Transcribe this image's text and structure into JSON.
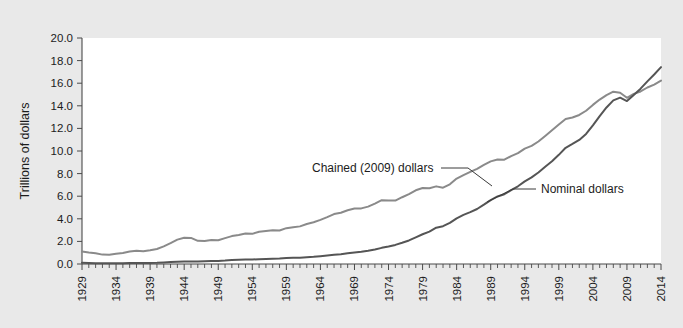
{
  "figure": {
    "background_color": "#e9e9e9",
    "plot_background_color": "#ffffff"
  },
  "axis": {
    "ylabel": "Trillions of dollars",
    "y_ticks": [
      "0.0",
      "2.0",
      "4.0",
      "6.0",
      "8.0",
      "10.0",
      "12.0",
      "14.0",
      "16.0",
      "18.0",
      "20.0"
    ],
    "x_ticks": [
      "1929",
      "1934",
      "1939",
      "1944",
      "1949",
      "1954",
      "1959",
      "1964",
      "1969",
      "1974",
      "1979",
      "1984",
      "1989",
      "1994",
      "1999",
      "2004",
      "2009",
      "2014"
    ]
  },
  "annotations": {
    "chained_label": "Chained (2009) dollars",
    "nominal_label": "Nominal dollars"
  },
  "chart_data": {
    "type": "line",
    "title": "",
    "xlabel": "",
    "ylabel": "Trillions of dollars",
    "xlim": [
      1929,
      2014
    ],
    "ylim": [
      0.0,
      20.0
    ],
    "grid": false,
    "legend_position": "inline-annotation",
    "x": [
      1929,
      1930,
      1931,
      1932,
      1933,
      1934,
      1935,
      1936,
      1937,
      1938,
      1939,
      1940,
      1941,
      1942,
      1943,
      1944,
      1945,
      1946,
      1947,
      1948,
      1949,
      1950,
      1951,
      1952,
      1953,
      1954,
      1955,
      1956,
      1957,
      1958,
      1959,
      1960,
      1961,
      1962,
      1963,
      1964,
      1965,
      1966,
      1967,
      1968,
      1969,
      1970,
      1971,
      1972,
      1973,
      1974,
      1975,
      1976,
      1977,
      1978,
      1979,
      1980,
      1981,
      1982,
      1983,
      1984,
      1985,
      1986,
      1987,
      1988,
      1989,
      1990,
      1991,
      1992,
      1993,
      1994,
      1995,
      1996,
      1997,
      1998,
      1999,
      2000,
      2001,
      2002,
      2003,
      2004,
      2005,
      2006,
      2007,
      2008,
      2009,
      2010,
      2011,
      2012,
      2013,
      2014
    ],
    "series": [
      {
        "name": "Chained (2009) dollars",
        "color": "#8a8a8a",
        "values": [
          1.11,
          1.02,
          0.95,
          0.83,
          0.82,
          0.9,
          0.98,
          1.11,
          1.17,
          1.13,
          1.22,
          1.33,
          1.56,
          1.85,
          2.16,
          2.33,
          2.31,
          2.05,
          2.03,
          2.12,
          2.1,
          2.29,
          2.47,
          2.57,
          2.69,
          2.67,
          2.86,
          2.92,
          2.98,
          2.96,
          3.17,
          3.25,
          3.33,
          3.54,
          3.69,
          3.9,
          4.15,
          4.42,
          4.54,
          4.76,
          4.91,
          4.92,
          5.08,
          5.35,
          5.65,
          5.62,
          5.61,
          5.91,
          6.18,
          6.52,
          6.72,
          6.7,
          6.87,
          6.75,
          7.05,
          7.56,
          7.87,
          8.15,
          8.42,
          8.77,
          9.08,
          9.25,
          9.23,
          9.55,
          9.81,
          10.21,
          10.45,
          10.84,
          11.33,
          11.83,
          12.34,
          12.84,
          12.97,
          13.19,
          13.56,
          14.08,
          14.55,
          14.94,
          15.25,
          15.15,
          14.71,
          15.05,
          15.27,
          15.62,
          15.88,
          16.23
        ]
      },
      {
        "name": "Nominal dollars",
        "color": "#555555",
        "values": [
          0.105,
          0.092,
          0.077,
          0.059,
          0.057,
          0.067,
          0.074,
          0.085,
          0.093,
          0.087,
          0.093,
          0.103,
          0.129,
          0.166,
          0.203,
          0.224,
          0.228,
          0.228,
          0.25,
          0.275,
          0.273,
          0.3,
          0.347,
          0.367,
          0.389,
          0.391,
          0.426,
          0.45,
          0.474,
          0.481,
          0.522,
          0.543,
          0.563,
          0.605,
          0.638,
          0.685,
          0.743,
          0.815,
          0.862,
          0.943,
          1.02,
          1.076,
          1.168,
          1.282,
          1.429,
          1.549,
          1.689,
          1.878,
          2.086,
          2.357,
          2.632,
          2.863,
          3.211,
          3.345,
          3.638,
          4.041,
          4.347,
          4.59,
          4.87,
          5.253,
          5.658,
          5.98,
          6.174,
          6.539,
          6.879,
          7.309,
          7.664,
          8.1,
          8.609,
          9.089,
          9.661,
          10.285,
          10.622,
          10.978,
          11.511,
          12.275,
          13.094,
          13.856,
          14.478,
          14.719,
          14.419,
          14.964,
          15.518,
          16.163,
          16.768,
          17.418
        ]
      }
    ]
  }
}
